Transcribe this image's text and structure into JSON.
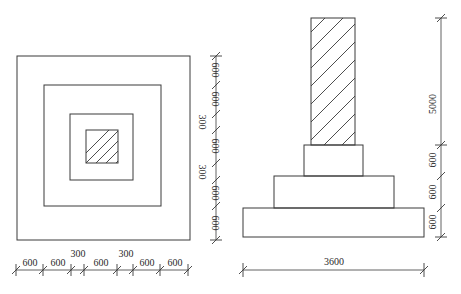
{
  "plan_view": {
    "horizontal_dimensions": [
      "600",
      "600",
      "300",
      "600",
      "300",
      "600",
      "600"
    ],
    "vertical_dimensions": [
      "600",
      "600",
      "300",
      "600",
      "300",
      "600",
      "600"
    ]
  },
  "elevation_view": {
    "column_height_label": "5000",
    "step_heights": [
      "600",
      "600",
      "600"
    ],
    "base_width_label": "3600"
  },
  "colors": {
    "line": "#3a3a3a",
    "background": "#ffffff"
  }
}
